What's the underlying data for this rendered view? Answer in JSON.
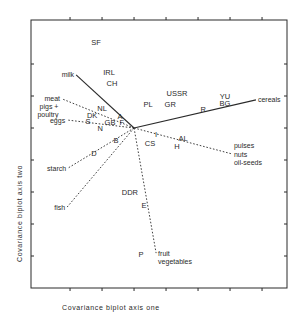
{
  "chart_data": {
    "type": "scatter",
    "subtype": "biplot",
    "title": "",
    "xlabel": "Covariance biplot axis one",
    "ylabel": "Covariance biplot axis two",
    "xlim": [
      -3.22,
      4.78
    ],
    "ylim": [
      -5.0,
      3.375
    ],
    "x_ticks": [
      -2,
      -1,
      0,
      1,
      2,
      3,
      4
    ],
    "y_ticks": [
      -4,
      -3,
      -2,
      -1,
      0,
      1,
      2
    ],
    "tick_labels_shown": false,
    "grid": false,
    "points": [
      {
        "label": "SF",
        "x": -1.19,
        "y": 2.69
      },
      {
        "label": "IRL",
        "x": -0.78,
        "y": 1.75
      },
      {
        "label": "CH",
        "x": -0.69,
        "y": 1.41
      },
      {
        "label": "NL",
        "x": -1.0,
        "y": 0.63
      },
      {
        "label": "A",
        "x": -0.44,
        "y": 0.38
      },
      {
        "label": "DK",
        "x": -1.31,
        "y": 0.41
      },
      {
        "label": "S",
        "x": -1.44,
        "y": 0.22
      },
      {
        "label": "GB",
        "x": -0.75,
        "y": 0.19
      },
      {
        "label": "F",
        "x": -0.38,
        "y": 0.19
      },
      {
        "label": "N",
        "x": -1.06,
        "y": 0.0
      },
      {
        "label": "B",
        "x": -0.56,
        "y": -0.38
      },
      {
        "label": "D",
        "x": -1.25,
        "y": -0.78
      },
      {
        "label": "PL",
        "x": 0.44,
        "y": 0.75
      },
      {
        "label": "GR",
        "x": 1.13,
        "y": 0.75
      },
      {
        "label": "USSR",
        "x": 1.34,
        "y": 1.09
      },
      {
        "label": "R",
        "x": 2.16,
        "y": 0.59
      },
      {
        "label": "YU",
        "x": 2.84,
        "y": 1.0
      },
      {
        "label": "BG",
        "x": 2.84,
        "y": 0.78
      },
      {
        "label": "I",
        "x": 0.69,
        "y": -0.19
      },
      {
        "label": "CS",
        "x": 0.5,
        "y": -0.47
      },
      {
        "label": "AL",
        "x": 1.53,
        "y": -0.31
      },
      {
        "label": "H",
        "x": 1.34,
        "y": -0.56
      },
      {
        "label": "DDR",
        "x": -0.13,
        "y": -2.0
      },
      {
        "label": "E",
        "x": 0.31,
        "y": -2.41
      },
      {
        "label": "P",
        "x": 0.22,
        "y": -3.94
      }
    ],
    "vectors": [
      {
        "label": [
          "milk"
        ],
        "x": -1.81,
        "y": 1.66,
        "style": "solid",
        "anchor": "end"
      },
      {
        "label": [
          "meat"
        ],
        "x": -2.25,
        "y": 0.91,
        "style": "dashed",
        "anchor": "end"
      },
      {
        "label": [
          "pigs +",
          "poultry"
        ],
        "x": -2.3,
        "y": 0.55,
        "style": "dashed",
        "anchor": "end"
      },
      {
        "label": [
          "eggs"
        ],
        "x": -2.09,
        "y": 0.25,
        "style": "dashed",
        "anchor": "end"
      },
      {
        "label": [
          "starch"
        ],
        "x": -2.06,
        "y": -1.25,
        "style": "dashed",
        "anchor": "end"
      },
      {
        "label": [
          "fish"
        ],
        "x": -2.09,
        "y": -2.47,
        "style": "dashed",
        "anchor": "end"
      },
      {
        "label": [
          "fruit",
          "vegetables"
        ],
        "x": 0.69,
        "y": -3.91,
        "style": "dashed",
        "anchor": "start"
      },
      {
        "label": [
          "pulses",
          "nuts",
          "oil-seeds"
        ],
        "x": 3.06,
        "y": -0.81,
        "style": "dashed",
        "anchor": "start"
      },
      {
        "label": [
          "cereals"
        ],
        "x": 3.81,
        "y": 0.88,
        "style": "solid",
        "anchor": "start"
      }
    ]
  },
  "colors": {
    "ink": "#2a2a2a",
    "background": "#ffffff"
  }
}
